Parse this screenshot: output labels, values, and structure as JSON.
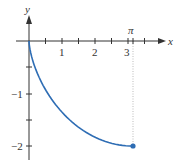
{
  "chart_data": {
    "type": "line",
    "title": "",
    "xlabel": "x",
    "ylabel": "y",
    "xlim": [
      0,
      3.5
    ],
    "ylim": [
      -2.1,
      0.4
    ],
    "x_ticks": [
      0.5,
      1,
      1.5,
      2,
      2.5,
      3,
      3.5
    ],
    "x_tick_labels": [
      "",
      "1",
      "",
      "2",
      "",
      "3",
      ""
    ],
    "y_ticks": [
      -0.5,
      -1,
      -1.5,
      -2
    ],
    "y_tick_labels": [
      "",
      "-1",
      "",
      "-2"
    ],
    "annotations": [
      {
        "text": "π",
        "x": 3.1416,
        "note": "dotted vertical guide from axis to endpoint"
      }
    ],
    "grid": false,
    "series": [
      {
        "name": "cycloid curve",
        "color": "#2e6db4",
        "parametric": "x = t - sin t, y = -(1 - cos t), t in [0, π]",
        "x": [
          0,
          0.0001,
          0.0014,
          0.0069,
          0.0213,
          0.0507,
          0.1023,
          0.1834,
          0.3009,
          0.4623,
          0.6736,
          0.9389,
          1.2617,
          1.6427,
          2.0807,
          2.5725,
          3.1416
        ],
        "y": [
          0,
          -0.0049,
          -0.0192,
          -0.0432,
          -0.0761,
          -0.1173,
          -0.2929,
          -0.4264,
          -0.5,
          -0.6737,
          -0.8264,
          -1.0,
          -1.2,
          -1.4,
          -1.6,
          -1.85,
          -2.0
        ]
      }
    ],
    "endpoint": {
      "x": 3.1416,
      "y": -2,
      "marker": "dot"
    }
  },
  "labels": {
    "x_axis": "x",
    "y_axis": "y",
    "pi": "π",
    "x1": "1",
    "x2": "2",
    "x3": "3",
    "ym1": "−1",
    "ym2": "−2"
  },
  "colors": {
    "curve": "#2e6db4",
    "axis": "#333333",
    "guide": "#aaaaaa"
  }
}
